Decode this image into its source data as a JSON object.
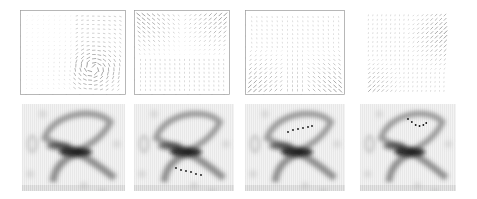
{
  "figure": {
    "rows": 2,
    "cols": 4,
    "top_row": {
      "description": "vector (quiver) fields",
      "panels": [
        {
          "id": "q1",
          "x": 20,
          "y": 10,
          "w": 106,
          "h": 85,
          "framed": true,
          "pattern": "radial-lower-right"
        },
        {
          "id": "q2",
          "x": 134,
          "y": 10,
          "w": 96,
          "h": 85,
          "framed": true,
          "pattern": "upper-corners"
        },
        {
          "id": "q3",
          "x": 245,
          "y": 10,
          "w": 100,
          "h": 85,
          "framed": true,
          "pattern": "lower-corners"
        },
        {
          "id": "q4",
          "x": 362,
          "y": 10,
          "w": 88,
          "h": 88,
          "framed": false,
          "pattern": "upper-right-lower-left"
        }
      ]
    },
    "bottom_row": {
      "description": "density maps with trajectory dots",
      "panels": [
        {
          "id": "d1",
          "x": 22,
          "y": 104,
          "w": 103,
          "h": 87,
          "trajectory": []
        },
        {
          "id": "d2",
          "x": 134,
          "y": 104,
          "w": 100,
          "h": 87,
          "trajectory": [
            [
              42,
              64
            ],
            [
              47,
              66
            ],
            [
              52,
              67
            ],
            [
              57,
              68
            ],
            [
              62,
              70
            ],
            [
              67,
              71
            ]
          ]
        },
        {
          "id": "d3",
          "x": 245,
          "y": 104,
          "w": 100,
          "h": 87,
          "trajectory": [
            [
              43,
              28
            ],
            [
              48,
              26
            ],
            [
              53,
              25
            ],
            [
              58,
              24
            ],
            [
              63,
              23
            ],
            [
              67,
              22
            ]
          ]
        },
        {
          "id": "d4",
          "x": 360,
          "y": 104,
          "w": 96,
          "h": 87,
          "trajectory": [
            [
              50,
              15
            ],
            [
              54,
              18
            ],
            [
              58,
              21
            ],
            [
              62,
              22
            ],
            [
              66,
              21
            ],
            [
              69,
              19
            ]
          ]
        }
      ]
    },
    "colors": {
      "ink": "#333333",
      "frame": "#999999",
      "tick": "#aaaaaa"
    }
  }
}
